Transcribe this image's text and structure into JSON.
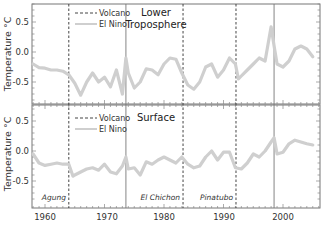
{
  "chart_data": {
    "type": "line",
    "x_range": [
      1957.8,
      2006.2
    ],
    "xticks": [
      1960,
      1970,
      1980,
      1990,
      2000
    ],
    "xtick_labels": [
      "1960",
      "1970",
      "1980",
      "1990",
      "2000"
    ],
    "legend": [
      {
        "label": "Volcano",
        "style": "dashed"
      },
      {
        "label": "El Nino",
        "style": "solid-gray"
      }
    ],
    "events": {
      "volcanoes": [
        {
          "name": "Agung",
          "year": 1964.0
        },
        {
          "name": "El Chichon",
          "year": 1983.2
        },
        {
          "name": "Pinatubo",
          "year": 1992.1
        }
      ],
      "el_nino": [
        {
          "year": 1973.6
        },
        {
          "year": 1998.5
        }
      ]
    },
    "panels": [
      {
        "title_line1": "Lower",
        "title_line2": "Troposphere",
        "ylabel": "Temperature °C",
        "ylim": [
          -0.87,
          0.8
        ],
        "yticks": [
          0.5,
          0.0,
          -0.5
        ],
        "ytick_labels": [
          "0.5",
          "0.0",
          "-0.5"
        ],
        "series": [
          {
            "name": "Lower Troposphere",
            "x": [
              1958,
              1959,
              1960,
              1961,
              1962,
              1963,
              1964,
              1965,
              1966,
              1967,
              1968,
              1969,
              1970,
              1971,
              1972,
              1973,
              1973.6,
              1974,
              1975,
              1976,
              1977,
              1978,
              1979,
              1980,
              1981,
              1982,
              1983,
              1984,
              1985,
              1986,
              1987,
              1988,
              1989,
              1990,
              1991,
              1992,
              1992.5,
              1993,
              1994,
              1995,
              1996,
              1997,
              1998,
              1998.5,
              1999,
              2000,
              2001,
              2002,
              2003,
              2004,
              2005
            ],
            "y": [
              -0.2,
              -0.26,
              -0.27,
              -0.3,
              -0.3,
              -0.32,
              -0.38,
              -0.52,
              -0.72,
              -0.5,
              -0.35,
              -0.5,
              -0.42,
              -0.58,
              -0.3,
              -0.7,
              -0.1,
              -0.35,
              -0.6,
              -0.5,
              -0.28,
              -0.3,
              -0.38,
              -0.2,
              -0.1,
              -0.12,
              -0.35,
              -0.55,
              -0.62,
              -0.5,
              -0.25,
              -0.2,
              -0.42,
              -0.3,
              -0.1,
              -0.2,
              -0.45,
              -0.4,
              -0.3,
              -0.2,
              -0.1,
              -0.15,
              0.42,
              0.1,
              -0.2,
              -0.25,
              -0.15,
              0.05,
              0.1,
              0.05,
              -0.08
            ]
          }
        ]
      },
      {
        "title": "Surface",
        "ylabel": "Temperature °C",
        "ylim": [
          -0.95,
          0.75
        ],
        "yticks": [
          0.5,
          0.0,
          -0.5
        ],
        "ytick_labels": [
          "0.5",
          "0.0",
          "-0.5"
        ],
        "series": [
          {
            "name": "Surface",
            "x": [
              1958,
              1959,
              1960,
              1961,
              1962,
              1963,
              1964,
              1964.7,
              1965,
              1966,
              1967,
              1968,
              1969,
              1970,
              1971,
              1972,
              1973,
              1973.6,
              1974,
              1975,
              1976,
              1977,
              1978,
              1979,
              1980,
              1981,
              1982,
              1983,
              1984,
              1985,
              1986,
              1987,
              1988,
              1989,
              1990,
              1991,
              1992,
              1993,
              1994,
              1995,
              1996,
              1997,
              1998,
              1998.5,
              1999,
              2000,
              2001,
              2002,
              2003,
              2004,
              2005
            ],
            "y": [
              -0.05,
              -0.2,
              -0.24,
              -0.22,
              -0.2,
              -0.22,
              -0.22,
              -0.42,
              -0.4,
              -0.35,
              -0.3,
              -0.28,
              -0.32,
              -0.22,
              -0.35,
              -0.38,
              -0.25,
              -0.1,
              -0.3,
              -0.28,
              -0.4,
              -0.18,
              -0.22,
              -0.15,
              -0.1,
              -0.15,
              -0.2,
              -0.1,
              -0.22,
              -0.28,
              -0.25,
              -0.1,
              0.0,
              -0.15,
              -0.02,
              -0.02,
              -0.28,
              -0.3,
              -0.2,
              -0.05,
              -0.1,
              0.0,
              0.15,
              0.22,
              -0.05,
              -0.02,
              0.12,
              0.18,
              0.15,
              0.12,
              0.1
            ]
          }
        ]
      }
    ]
  },
  "labels": {
    "legend_volcano": "Volcano",
    "legend_elnino": "El Nino",
    "top_title_1": "Lower",
    "top_title_2": "Troposphere",
    "bottom_title": "Surface",
    "ylabel_top": "Temperature °C",
    "ylabel_bottom": "Temperature °C",
    "agung": "Agung",
    "el_chichon": "El Chichon",
    "pinatubo": "Pinatubo",
    "x1960": "1960",
    "x1970": "1970",
    "x1980": "1980",
    "x1990": "1990",
    "x2000": "2000",
    "y_top_05": "0.5",
    "y_top_00": "0.0",
    "y_top_m05": "-0.5",
    "y_bot_05": "0.5",
    "y_bot_00": "0.0",
    "y_bot_m05": "-0.5"
  },
  "colors": {
    "trace": "#c9c9c9",
    "axis": "#666666",
    "volcano_line": "#444444",
    "elnino_line": "#777777"
  }
}
